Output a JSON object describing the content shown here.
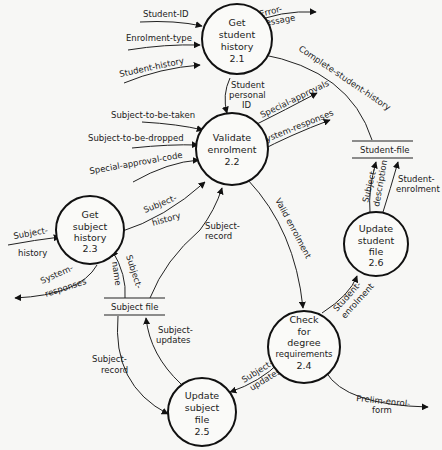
{
  "processes": [
    {
      "id": "2.1",
      "lines": [
        "Get",
        "student",
        "history",
        "2.1"
      ]
    },
    {
      "id": "2.2",
      "lines": [
        "Validate",
        "enrolment",
        "2.2"
      ]
    },
    {
      "id": "2.3",
      "lines": [
        "Get",
        "subject",
        "history",
        "2.3"
      ]
    },
    {
      "id": "2.4",
      "lines": [
        "Check",
        "for",
        "degree",
        "requirements",
        "2.4"
      ]
    },
    {
      "id": "2.5",
      "lines": [
        "Update",
        "subject",
        "file",
        "2.5"
      ]
    },
    {
      "id": "2.6",
      "lines": [
        "Update",
        "student",
        "file",
        "2.6"
      ]
    }
  ],
  "stores": {
    "student_file": "Student-file",
    "subject_file": "Subject file"
  },
  "flows": {
    "student_id": "Student-ID",
    "enrolment_type": "Enrolment-type",
    "student_history_in": "Student-history",
    "error_message_1": "Error-",
    "error_message_2": "message",
    "complete_student_history": "Complete-student-history",
    "student_personal_id_1": "Student",
    "student_personal_id_2": "personal",
    "student_personal_id_3": "ID",
    "subject_to_be_taken": "Subject-to-be-taken",
    "subject_to_be_dropped": "Subject-to-be-dropped",
    "special_approval_code": "Special-approval-code",
    "special_approvals": "Special-approvals",
    "system_responses_22": "System-responses",
    "subject_history_23_22_1": "Subject-",
    "subject_history_23_22_2": "history",
    "subject_history_in_1": "Subject-",
    "subject_history_in_2": "history",
    "system_responses_23_1": "System-",
    "system_responses_23_2": "responses",
    "subject_name_1": "Subject-",
    "subject_name_2": "name",
    "subject_record_to_22_1": "Subject-",
    "subject_record_to_22_2": "record",
    "valid_enrolment": "Valid enrolment",
    "subject_description_1": "Subject-",
    "subject_description_2": "description",
    "student_enrolment_to_file_1": "Student-",
    "student_enrolment_to_file_2": "enrolment",
    "student_enrolment_24_26_1": "Student-",
    "student_enrolment_24_26_2": "enrolment",
    "subject_updates_24_25_1": "Subject-",
    "subject_updates_24_25_2": "updates",
    "subject_updates_25_file_1": "Subject-",
    "subject_updates_25_file_2": "updates",
    "subject_record_to_25_1": "Subject-",
    "subject_record_to_25_2": "record",
    "prelim_enrol_form_1": "Prelim-enrol-",
    "prelim_enrol_form_2": "form"
  },
  "colors": {
    "line": "#222222",
    "background": "#f7f7f5"
  }
}
